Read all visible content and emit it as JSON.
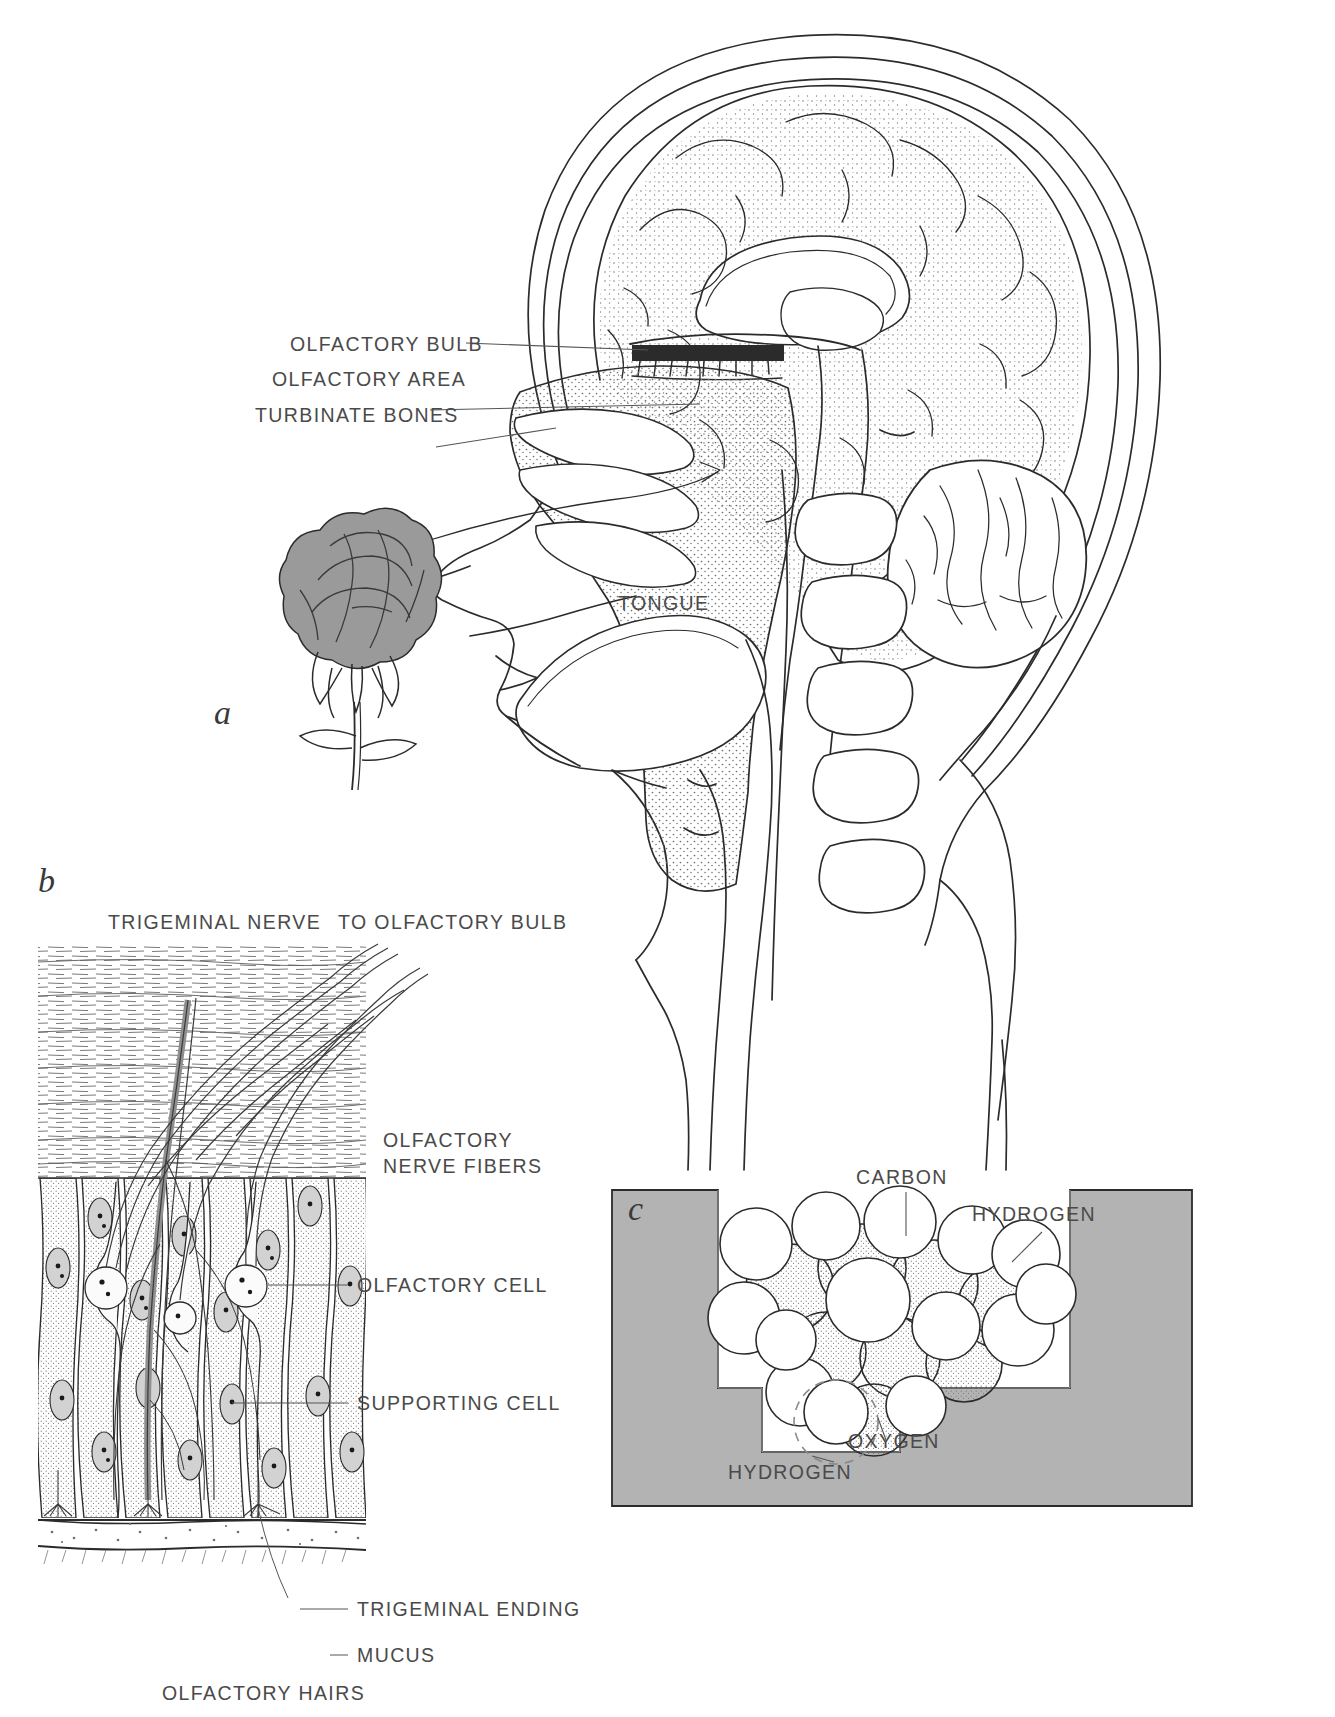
{
  "figure": {
    "panels": [
      {
        "id": "a",
        "letter": "a",
        "caption": "Sagittal section of the head showing the olfactory pathway",
        "labels": [
          {
            "name": "olfactory-bulb",
            "text": "OLFACTORY BULB"
          },
          {
            "name": "olfactory-area",
            "text": "OLFACTORY AREA"
          },
          {
            "name": "turbinate-bones",
            "text": "TURBINATE BONES"
          },
          {
            "name": "tongue",
            "text": "TONGUE"
          }
        ],
        "objects": [
          "rose",
          "brain",
          "cerebellum",
          "nasal-cavity",
          "spinal-column"
        ]
      },
      {
        "id": "b",
        "letter": "b",
        "caption": "Detail of the olfactory epithelium",
        "labels": [
          {
            "name": "trigeminal-nerve",
            "text": "TRIGEMINAL NERVE"
          },
          {
            "name": "to-olfactory-bulb",
            "text": "TO OLFACTORY BULB"
          },
          {
            "name": "olfactory-nerve-fibers-line1",
            "text": "OLFACTORY"
          },
          {
            "name": "olfactory-nerve-fibers-line2",
            "text": "NERVE FIBERS"
          },
          {
            "name": "olfactory-cell",
            "text": "OLFACTORY CELL"
          },
          {
            "name": "supporting-cell",
            "text": "SUPPORTING CELL"
          },
          {
            "name": "trigeminal-ending",
            "text": "TRIGEMINAL ENDING"
          },
          {
            "name": "mucus",
            "text": "MUCUS"
          },
          {
            "name": "olfactory-hairs",
            "text": "OLFACTORY HAIRS"
          }
        ]
      },
      {
        "id": "c",
        "letter": "c",
        "caption": "Odor molecule fitting into a receptor site",
        "labels": [
          {
            "name": "carbon",
            "text": "CARBON"
          },
          {
            "name": "hydrogen-top",
            "text": "HYDROGEN"
          },
          {
            "name": "oxygen",
            "text": "OXYGEN"
          },
          {
            "name": "hydrogen-bottom",
            "text": "HYDROGEN"
          }
        ]
      }
    ]
  },
  "colors": {
    "ink": "#2b2b2b",
    "label_text": "#4a4a4a",
    "leader_line": "#555555",
    "receptor_fill": "#b3b3b3",
    "rose_fill": "#9a9a9a",
    "stipple": "#6f6f6f",
    "page_background": "#ffffff"
  }
}
